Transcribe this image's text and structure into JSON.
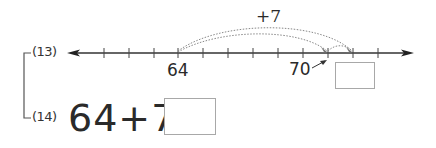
{
  "problems": [
    {
      "number": "(13)",
      "type": "number-line",
      "number_line": {
        "start_label": "64",
        "end_label": "70",
        "jump_label": "+7",
        "ticks_visible": 12,
        "start_value": 64,
        "intermediate_value": 70,
        "target_value": 71,
        "answer_box_value": ""
      }
    },
    {
      "number": "(14)",
      "type": "equation",
      "equation": "64+7=",
      "answer_box_value": ""
    }
  ],
  "colors": {
    "line": "#333333",
    "dotted_arc": "#888888",
    "box_border": "#a8a8a8",
    "text": "#2a2a2a"
  }
}
